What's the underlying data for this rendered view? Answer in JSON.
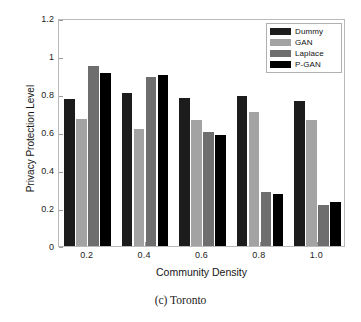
{
  "chart_data": {
    "type": "bar",
    "title": "",
    "caption": "(c) Toronto",
    "xlabel": "Community Density",
    "ylabel": "Privacy Protection Level",
    "categories": [
      "0.2",
      "0.4",
      "0.6",
      "0.8",
      "1.0"
    ],
    "xtick_labels": [
      "0.2",
      "0.4",
      "0.6",
      "0.8",
      "1.0"
    ],
    "ytick_labels": [
      "0",
      "0.2",
      "0.4",
      "0.6",
      "0.8",
      "1",
      "1.2"
    ],
    "ytick_values": [
      0,
      0.2,
      0.4,
      0.6,
      0.8,
      1,
      1.2
    ],
    "ylim": [
      0,
      1.2
    ],
    "grid": false,
    "legend_position": "top-right",
    "series": [
      {
        "name": "Dummy",
        "color": "#1c1c1c",
        "values": [
          0.775,
          0.805,
          0.781,
          0.787,
          0.765
        ]
      },
      {
        "name": "GAN",
        "color": "#a3a3a3",
        "values": [
          0.67,
          0.614,
          0.661,
          0.704,
          0.665
        ]
      },
      {
        "name": "Laplace",
        "color": "#6e6e6e",
        "values": [
          0.946,
          0.892,
          0.598,
          0.285,
          0.214
        ]
      },
      {
        "name": "P-GAN",
        "color": "#000000",
        "values": [
          0.91,
          0.898,
          0.586,
          0.276,
          0.232
        ]
      }
    ]
  },
  "legend": {
    "items": [
      {
        "label": "Dummy",
        "color": "#1c1c1c"
      },
      {
        "label": "GAN",
        "color": "#a3a3a3"
      },
      {
        "label": "Laplace",
        "color": "#6e6e6e"
      },
      {
        "label": "P-GAN",
        "color": "#000000"
      }
    ]
  },
  "axes": {
    "frame_color": "#b9b9b9",
    "tick_color": "#9a9a9a",
    "text_color": "#1d1d1d"
  }
}
